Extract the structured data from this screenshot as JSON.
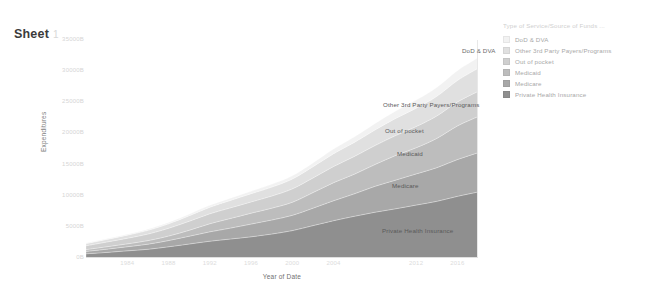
{
  "worksheet": {
    "title": "Sheet",
    "title_number": "1"
  },
  "legend": {
    "title": "Type of Service/Source of Funds ...",
    "items": [
      {
        "label": "DoD & DVA",
        "color": "#f2f2f2"
      },
      {
        "label": "Other 3rd Party Payers/Programs",
        "color": "#e0e0e0"
      },
      {
        "label": "Out of pocket",
        "color": "#cfcfcf"
      },
      {
        "label": "Medicaid",
        "color": "#bdbdbd"
      },
      {
        "label": "Medicare",
        "color": "#a8a8a8"
      },
      {
        "label": "Private Health Insurance",
        "color": "#8f8f8f"
      }
    ]
  },
  "mark_labels": [
    {
      "text": "DoD & DVA",
      "x": 462,
      "y": 47,
      "tone": "light"
    },
    {
      "text": "Other 3rd Party Payers/Programs",
      "x": 383,
      "y": 101,
      "tone": "dark"
    },
    {
      "text": "Out of pocket",
      "x": 385,
      "y": 127,
      "tone": "dark"
    },
    {
      "text": "Medicaid",
      "x": 397,
      "y": 150,
      "tone": "dark"
    },
    {
      "text": "Medicare",
      "x": 392,
      "y": 182,
      "tone": "dark"
    },
    {
      "text": "Private Health Insurance",
      "x": 382,
      "y": 227,
      "tone": "dark"
    }
  ],
  "chart_data": {
    "type": "area",
    "stacked": true,
    "title": "Sheet 1",
    "xlabel": "Year of Date",
    "ylabel": "Expenditures",
    "grid": false,
    "legend_position": "right",
    "ylim": [
      0,
      35000
    ],
    "ytick_labels": [
      "0B",
      "5000B",
      "10000B",
      "15000B",
      "20000B",
      "25000B",
      "30000B",
      "35000B"
    ],
    "ytick_values": [
      0,
      5000,
      10000,
      15000,
      20000,
      25000,
      30000,
      35000
    ],
    "xlim": [
      1980,
      2018
    ],
    "xtick_labels": [
      "1984",
      "1988",
      "1992",
      "1996",
      "2000",
      "2004",
      "2012",
      "2016"
    ],
    "xtick_values": [
      1984,
      1988,
      1992,
      1996,
      2000,
      2004,
      2012,
      2016
    ],
    "x": [
      1980,
      1982,
      1984,
      1986,
      1988,
      1990,
      1992,
      1994,
      1996,
      1998,
      2000,
      2002,
      2004,
      2006,
      2008,
      2010,
      2012,
      2014,
      2016,
      2018
    ],
    "series": [
      {
        "name": "Private Health Insurance",
        "color": "#8f8f8f",
        "values": [
          680,
          900,
          1150,
          1400,
          1800,
          2250,
          2700,
          3050,
          3400,
          3850,
          4400,
          5200,
          6000,
          6700,
          7350,
          7900,
          8500,
          9100,
          9900,
          10600
        ]
      },
      {
        "name": "Medicare",
        "color": "#a8a8a8",
        "values": [
          380,
          520,
          660,
          820,
          1000,
          1250,
          1500,
          1750,
          2050,
          2250,
          2450,
          2800,
          3200,
          3600,
          4150,
          4600,
          5000,
          5400,
          5900,
          6300
        ]
      },
      {
        "name": "Medicaid",
        "color": "#bdbdbd",
        "values": [
          290,
          380,
          460,
          570,
          720,
          950,
          1300,
          1550,
          1750,
          1900,
          2100,
          2500,
          2900,
          3150,
          3500,
          3950,
          4200,
          4700,
          5400,
          5800
        ]
      },
      {
        "name": "Out of pocket",
        "color": "#cfcfcf",
        "values": [
          620,
          760,
          900,
          1050,
          1250,
          1450,
          1600,
          1700,
          1800,
          1950,
          2150,
          2350,
          2600,
          2850,
          3050,
          3200,
          3400,
          3600,
          3850,
          4050
        ]
      },
      {
        "name": "Other 3rd Party Payers/Programs",
        "color": "#e0e0e0",
        "values": [
          340,
          420,
          500,
          600,
          720,
          880,
          1050,
          1200,
          1320,
          1430,
          1580,
          1800,
          2050,
          2250,
          2500,
          2750,
          2950,
          3150,
          3450,
          3700
        ]
      },
      {
        "name": "DoD & DVA",
        "color": "#f2f2f2",
        "values": [
          90,
          110,
          135,
          165,
          200,
          245,
          300,
          350,
          400,
          450,
          520,
          620,
          750,
          880,
          1020,
          1180,
          1300,
          1420,
          1580,
          1700
        ]
      }
    ]
  }
}
